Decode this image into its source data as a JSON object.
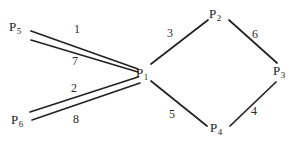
{
  "diagram": {
    "stroke_color": "#222222",
    "text_color": "#1a1a1a",
    "background_color": "#ffffff",
    "nodes": [
      {
        "id": "P1",
        "base": "P",
        "subscript": "1",
        "label": "P1",
        "x": 144,
        "y": 73,
        "label_x": 136,
        "label_y": 66
      },
      {
        "id": "P2",
        "base": "P",
        "subscript": "2",
        "label": "P2",
        "x": 217,
        "y": 17,
        "label_x": 209,
        "label_y": 7
      },
      {
        "id": "P3",
        "base": "P",
        "subscript": "3",
        "label": "P3",
        "x": 281,
        "y": 72,
        "label_x": 273,
        "label_y": 64
      },
      {
        "id": "P4",
        "base": "P",
        "subscript": "4",
        "label": "P4",
        "x": 218,
        "y": 129,
        "label_x": 210,
        "label_y": 121
      },
      {
        "id": "P5",
        "base": "P",
        "subscript": "5",
        "label": "P5",
        "x": 18,
        "y": 28,
        "label_x": 9,
        "label_y": 20
      },
      {
        "id": "P6",
        "base": "P",
        "subscript": "6",
        "label": "P6",
        "x": 20,
        "y": 121,
        "label_x": 11,
        "label_y": 113
      }
    ],
    "edges": [
      {
        "id": "e1",
        "from": "P5",
        "to": "P1",
        "weight": "1",
        "x1": 31,
        "y1": 31,
        "x2": 138,
        "y2": 69,
        "label_x": 74,
        "label_y": 23
      },
      {
        "id": "e7",
        "from": "P5",
        "to": "P1",
        "weight": "7",
        "x1": 31,
        "y1": 40,
        "x2": 138,
        "y2": 72,
        "label_x": 72,
        "label_y": 55
      },
      {
        "id": "e2",
        "from": "P6",
        "to": "P1",
        "weight": "2",
        "x1": 30,
        "y1": 112,
        "x2": 138,
        "y2": 77,
        "label_x": 71,
        "label_y": 82
      },
      {
        "id": "e8",
        "from": "P6",
        "to": "P1",
        "weight": "8",
        "x1": 32,
        "y1": 120,
        "x2": 140,
        "y2": 83,
        "label_x": 73,
        "label_y": 113
      },
      {
        "id": "e3",
        "from": "P1",
        "to": "P2",
        "weight": "3",
        "x1": 151,
        "y1": 64,
        "x2": 208,
        "y2": 20,
        "label_x": 167,
        "label_y": 27
      },
      {
        "id": "e6",
        "from": "P2",
        "to": "P3",
        "weight": "6",
        "x1": 229,
        "y1": 20,
        "x2": 277,
        "y2": 63,
        "label_x": 252,
        "label_y": 28
      },
      {
        "id": "e4",
        "from": "P3",
        "to": "P4",
        "weight": "4",
        "x1": 276,
        "y1": 82,
        "x2": 230,
        "y2": 126,
        "label_x": 251,
        "label_y": 105
      },
      {
        "id": "e5",
        "from": "P4",
        "to": "P1",
        "weight": "5",
        "x1": 207,
        "y1": 126,
        "x2": 151,
        "y2": 81,
        "label_x": 169,
        "label_y": 108
      }
    ]
  }
}
